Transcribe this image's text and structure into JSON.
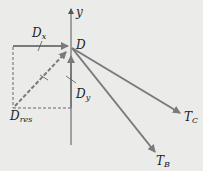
{
  "diagram": {
    "type": "free-body diagram",
    "background_color": "#ebebea",
    "vector_color": "#7a7a7a",
    "axis_color": "#555555",
    "origin": {
      "label": "D",
      "x": 71,
      "y": 47
    },
    "axis": {
      "label": "y"
    },
    "vectors": [
      {
        "name": "D_x",
        "base": "D",
        "sub": "x",
        "from": [
          13,
          46
        ],
        "to": [
          69,
          46
        ],
        "style": "solid"
      },
      {
        "name": "D_y",
        "base": "D",
        "sub": "y",
        "from": [
          71,
          108
        ],
        "to": [
          71,
          55
        ],
        "style": "solid"
      },
      {
        "name": "D_res",
        "base": "D",
        "sub": "res",
        "from": [
          15,
          106
        ],
        "to": [
          66,
          52
        ],
        "style": "dashed"
      },
      {
        "name": "T_C",
        "base": "T",
        "sub": "C",
        "from": [
          72,
          48
        ],
        "to": [
          180,
          113
        ],
        "style": "solid"
      },
      {
        "name": "T_B",
        "base": "T",
        "sub": "B",
        "from": [
          72,
          48
        ],
        "to": [
          155,
          152
        ],
        "style": "solid"
      }
    ],
    "labels": {
      "y": "y",
      "D": "D",
      "Dx_base": "D",
      "Dx_sub": "x",
      "Dy_base": "D",
      "Dy_sub": "y",
      "Dres_base": "D",
      "Dres_sub": "res",
      "TC_base": "T",
      "TC_sub": "C",
      "TB_base": "T",
      "TB_sub": "B"
    }
  }
}
